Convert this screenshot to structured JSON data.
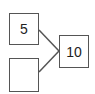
{
  "diagram": {
    "type": "number-bond",
    "parts": [
      {
        "id": "part-top",
        "value": "5"
      },
      {
        "id": "part-bottom",
        "value": ""
      }
    ],
    "whole": {
      "id": "whole",
      "value": "10"
    },
    "colors": {
      "stroke": "#555555",
      "text": "#222222",
      "background": "#ffffff"
    }
  }
}
